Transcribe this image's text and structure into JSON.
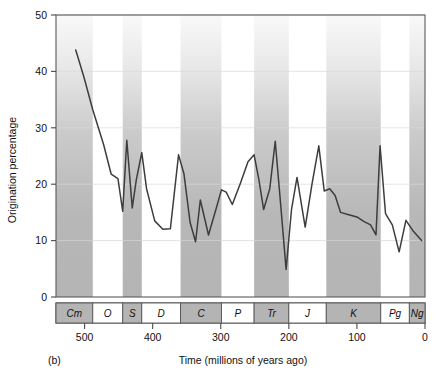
{
  "panel": {
    "label": "(b)"
  },
  "axes": {
    "y_title": "Origination percentage",
    "x_title": "Time (millions of years ago)",
    "y_ticks": [
      "0",
      "10",
      "20",
      "30",
      "40",
      "50"
    ],
    "x_ticks": [
      "500",
      "400",
      "300",
      "200",
      "100",
      "0"
    ]
  },
  "colors": {
    "line": "#3d3d3d",
    "band": "#b4b4b4",
    "band_light": "#ffffff",
    "frame": "#5a5a5a",
    "text": "#111111"
  },
  "chart_data": {
    "type": "line",
    "title": "",
    "xlabel": "Time (millions of years ago)",
    "ylabel": "Origination percentage",
    "xlim": [
      542,
      0
    ],
    "ylim": [
      0,
      50
    ],
    "x_reversed": true,
    "grid": true,
    "legend": "none",
    "x_tick_values": [
      500,
      400,
      300,
      200,
      100,
      0
    ],
    "y_tick_values": [
      0,
      10,
      20,
      30,
      40,
      50
    ],
    "series": [
      {
        "name": "Origination percentage",
        "points": [
          [
            513,
            43.8
          ],
          [
            501,
            39.0
          ],
          [
            488,
            33.2
          ],
          [
            472,
            27.0
          ],
          [
            461,
            21.8
          ],
          [
            451,
            21.0
          ],
          [
            444,
            15.2
          ],
          [
            438,
            27.8
          ],
          [
            430,
            15.8
          ],
          [
            424,
            20.8
          ],
          [
            416,
            25.6
          ],
          [
            409,
            19.2
          ],
          [
            397,
            13.5
          ],
          [
            385,
            12.0
          ],
          [
            374,
            12.1
          ],
          [
            362,
            25.2
          ],
          [
            354,
            21.8
          ],
          [
            345,
            13.2
          ],
          [
            337,
            9.8
          ],
          [
            330,
            17.2
          ],
          [
            318,
            11.0
          ],
          [
            306,
            16.0
          ],
          [
            299,
            19.0
          ],
          [
            292,
            18.6
          ],
          [
            283,
            16.4
          ],
          [
            271,
            20.2
          ],
          [
            260,
            24.0
          ],
          [
            251,
            25.2
          ],
          [
            244,
            20.8
          ],
          [
            237,
            15.5
          ],
          [
            228,
            19.2
          ],
          [
            220,
            27.6
          ],
          [
            213,
            17.8
          ],
          [
            204,
            4.9
          ],
          [
            196,
            15.6
          ],
          [
            188,
            21.2
          ],
          [
            176,
            12.4
          ],
          [
            166,
            20.0
          ],
          [
            156,
            26.8
          ],
          [
            148,
            18.8
          ],
          [
            140,
            19.2
          ],
          [
            132,
            18.0
          ],
          [
            124,
            15.0
          ],
          [
            112,
            14.6
          ],
          [
            100,
            14.2
          ],
          [
            90,
            13.4
          ],
          [
            80,
            12.8
          ],
          [
            72,
            11.0
          ],
          [
            66,
            26.8
          ],
          [
            58,
            14.8
          ],
          [
            48,
            12.8
          ],
          [
            38,
            8.0
          ],
          [
            28,
            13.6
          ],
          [
            18,
            11.8
          ],
          [
            5,
            10.0
          ]
        ]
      }
    ],
    "geologic_periods": [
      {
        "label": "Cm",
        "start": 542,
        "end": 488,
        "shaded": true
      },
      {
        "label": "O",
        "start": 488,
        "end": 444,
        "shaded": false
      },
      {
        "label": "S",
        "start": 444,
        "end": 416,
        "shaded": true
      },
      {
        "label": "D",
        "start": 416,
        "end": 359,
        "shaded": false
      },
      {
        "label": "C",
        "start": 359,
        "end": 299,
        "shaded": true
      },
      {
        "label": "P",
        "start": 299,
        "end": 251,
        "shaded": false
      },
      {
        "label": "Tr",
        "start": 251,
        "end": 200,
        "shaded": true
      },
      {
        "label": "J",
        "start": 200,
        "end": 145,
        "shaded": false
      },
      {
        "label": "K",
        "start": 145,
        "end": 65,
        "shaded": true
      },
      {
        "label": "Pg",
        "start": 65,
        "end": 23,
        "shaded": false
      },
      {
        "label": "Ng",
        "start": 23,
        "end": 0,
        "shaded": true
      }
    ]
  }
}
